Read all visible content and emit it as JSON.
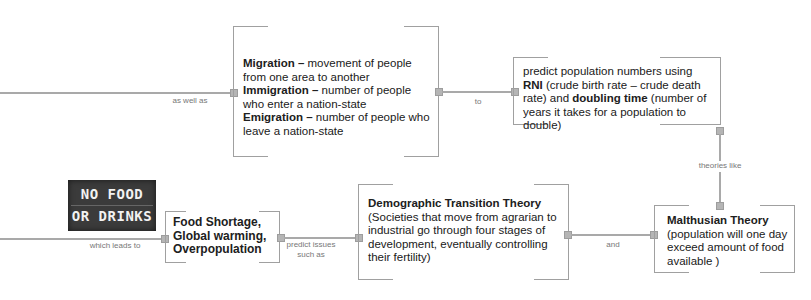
{
  "connectors": {
    "as_well_as": "as well as",
    "to": "to",
    "theories_like": "theories like",
    "which_leads_to": "which leads to",
    "predict_issues": "predict issues such as",
    "and": "and"
  },
  "nodes": {
    "migration": {
      "t1b": "Migration –",
      "t1": " movement of people from one area to another",
      "t2b": "Immigration –",
      "t2": " number of people who enter a nation-state",
      "t3b": "Emigration –",
      "t3": " number of people who leave a nation-state"
    },
    "predict": {
      "t1": "predict population numbers using ",
      "t2b": "RNI",
      "t2": " (crude birth rate – crude death rate) and ",
      "t3b": "doubling time",
      "t3": " (number of years it takes for a population to double)"
    },
    "issues": {
      "title": "Food Shortage, Global warming, Overpopulation"
    },
    "demographic": {
      "title": "Demographic Transition Theory",
      "body": "(Societies that move from agrarian to industrial go through four stages of development, eventually controlling their fertility)"
    },
    "malthusian": {
      "title": "Malthusian Theory",
      "body": "(population will one day exceed amount of food available )"
    }
  },
  "image": {
    "line1": "NO FOOD",
    "line2": "OR DRINKS"
  }
}
